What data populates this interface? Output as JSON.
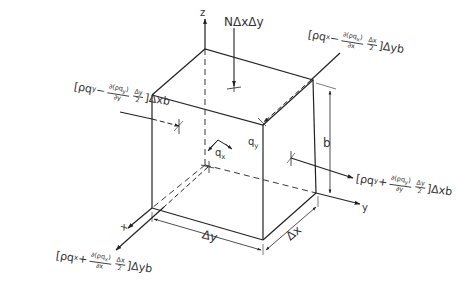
{
  "diagram": {
    "type": "isometric control volume (cube) with mass flux terms",
    "axes": {
      "z": "z",
      "x": "x",
      "y": "y"
    },
    "dimensions": {
      "height": "b",
      "dx": "Δx",
      "dy": "Δy"
    },
    "top_flux": "NΔxΔy",
    "velocity_labels": {
      "qx": "q",
      "qx_sub": "x",
      "qy": "q",
      "qy_sub": "y"
    },
    "fluxes": {
      "x_in": {
        "open": "[ρq",
        "sub": "x",
        "sign": " − ",
        "num": "∂(ρq",
        "num_sub": "x",
        "num_close": ")",
        "den": "∂x",
        "frac2_num": "Δx",
        "frac2_den": "2",
        "close": "]Δyb"
      },
      "x_out": {
        "open": "[ρq",
        "sub": "x",
        "sign": " + ",
        "num": "∂(ρq",
        "num_sub": "x",
        "num_close": ")",
        "den": "∂x",
        "frac2_num": "Δx",
        "frac2_den": "2",
        "close": "]Δyb"
      },
      "y_in": {
        "open": "[ρq",
        "sub": "y",
        "sign": " − ",
        "num": "∂(ρq",
        "num_sub": "y",
        "num_close": ")",
        "den": "∂y",
        "frac2_num": "Δy",
        "frac2_den": "2",
        "close": "]Δxb"
      },
      "y_out": {
        "open": "[ρq",
        "sub": "y",
        "sign": " + ",
        "num": "∂(ρq",
        "num_sub": "y",
        "num_close": ")",
        "den": "∂y",
        "frac2_num": "Δy",
        "frac2_den": "2",
        "close": "]Δxb"
      }
    },
    "colors": {
      "line": "#222222",
      "background": "#ffffff"
    }
  }
}
